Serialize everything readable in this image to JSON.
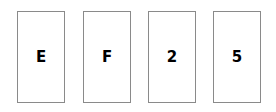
{
  "cards": [
    {
      "face": "E"
    },
    {
      "face": "F"
    },
    {
      "face": "2"
    },
    {
      "face": "5"
    }
  ]
}
